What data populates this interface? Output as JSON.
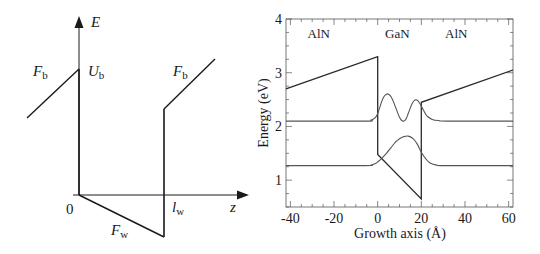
{
  "left_diagram": {
    "axis_y_label": "E",
    "axis_x_label": "z",
    "origin_label": "0",
    "barrier_height_label": "U",
    "barrier_height_sub": "b",
    "barrier_field_left_label": "F",
    "barrier_field_left_sub": "b",
    "barrier_field_right_label": "F",
    "barrier_field_right_sub": "b",
    "well_field_label": "F",
    "well_field_sub": "w",
    "well_width_label": "l",
    "well_width_sub": "w",
    "line_color": "#1a1a1a"
  },
  "chart_data": {
    "type": "line",
    "title": "",
    "xlabel": "Growth axis (Å)",
    "ylabel": "Energy (eV)",
    "xlim": [
      -42,
      62
    ],
    "ylim": [
      0.5,
      4
    ],
    "xticks": [
      -40,
      -20,
      0,
      20,
      40,
      60
    ],
    "yticks": [
      1,
      2,
      3,
      4
    ],
    "grid": false,
    "legend": null,
    "annotations": [
      {
        "text": "AlN",
        "x": -27,
        "y": 3.65
      },
      {
        "text": "GaN",
        "x": 9,
        "y": 3.65
      },
      {
        "text": "AlN",
        "x": 36,
        "y": 3.65
      }
    ],
    "series": [
      {
        "name": "Conduction band edge",
        "x": [
          -42,
          0,
          0,
          20,
          20,
          62
        ],
        "y": [
          2.7,
          3.3,
          1.48,
          0.65,
          2.45,
          3.05
        ]
      },
      {
        "name": "Excited state (level 2.1 eV)",
        "level": 2.1,
        "x": [
          -42,
          -6,
          -3,
          -1,
          0,
          1,
          2,
          3,
          4,
          5,
          6,
          7,
          8,
          9,
          10,
          11,
          12,
          13,
          14,
          15,
          16,
          17,
          18,
          19,
          20,
          21,
          22,
          23,
          25,
          28,
          32,
          62
        ],
        "y": [
          2.1,
          2.1,
          2.12,
          2.17,
          2.24,
          2.36,
          2.48,
          2.56,
          2.6,
          2.6,
          2.56,
          2.48,
          2.38,
          2.27,
          2.17,
          2.11,
          2.1,
          2.14,
          2.24,
          2.35,
          2.44,
          2.49,
          2.49,
          2.45,
          2.38,
          2.3,
          2.23,
          2.18,
          2.13,
          2.11,
          2.1,
          2.1
        ]
      },
      {
        "name": "Ground state (level 1.27 eV)",
        "level": 1.27,
        "x": [
          -42,
          -6,
          -3,
          -1,
          0,
          2,
          4,
          6,
          8,
          10,
          12,
          14,
          16,
          18,
          20,
          22,
          24,
          27,
          32,
          62
        ],
        "y": [
          1.27,
          1.27,
          1.28,
          1.31,
          1.34,
          1.41,
          1.5,
          1.6,
          1.7,
          1.77,
          1.81,
          1.82,
          1.78,
          1.68,
          1.52,
          1.4,
          1.32,
          1.28,
          1.27,
          1.27
        ]
      }
    ]
  }
}
